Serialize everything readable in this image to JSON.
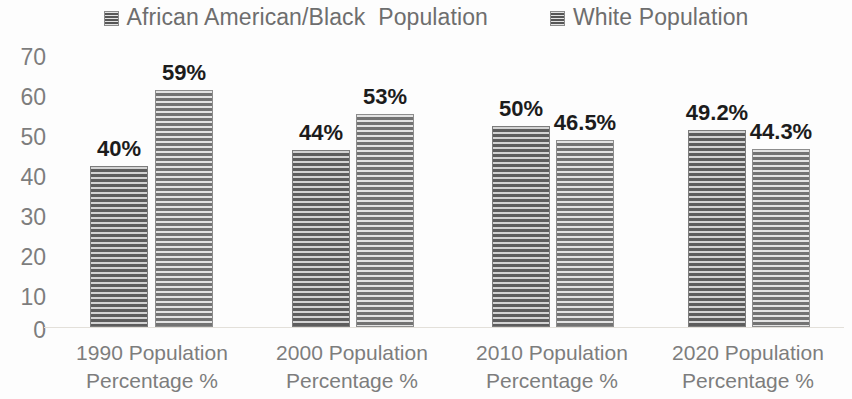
{
  "chart_data": {
    "type": "bar",
    "title": "",
    "subtitle": "",
    "xlabel": "",
    "ylabel": "",
    "ylim": [
      0,
      70
    ],
    "yticks": [
      "70",
      "60",
      "50",
      "40",
      "30",
      "20",
      "10",
      "0"
    ],
    "grid": false,
    "legend_position": "top-center",
    "categories": [
      "1990 Population Percentage %",
      "2000 Population Percentage %",
      "2010 Population Percentage %",
      "2020 Population Percentage %"
    ],
    "category_lines": [
      [
        "1990 Population",
        "Percentage %"
      ],
      [
        "2000 Population",
        "Percentage %"
      ],
      [
        "2010 Population",
        "Percentage %"
      ],
      [
        "2020 Population",
        "Percentage %"
      ]
    ],
    "series": [
      {
        "name": "African American/Black  Population",
        "values": [
          40,
          44,
          50,
          49.2
        ],
        "labels": [
          "40%",
          "44%",
          "50%",
          "49.2%"
        ],
        "color": "#8b8b8b"
      },
      {
        "name": "White Population",
        "values": [
          59,
          53,
          46.5,
          44.3
        ],
        "labels": [
          "59%",
          "53%",
          "46.5%",
          "44.3%"
        ],
        "color": "#9b9b9b"
      }
    ]
  },
  "legend": {
    "entries": [
      {
        "label": "African American/Black  Population",
        "swatch": "striped-gray-square"
      },
      {
        "label": "White Population",
        "swatch": "striped-gray-square"
      }
    ]
  }
}
